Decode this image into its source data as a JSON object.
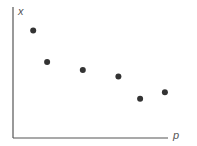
{
  "chart_data": {
    "type": "scatter",
    "title": "",
    "xlabel": "p",
    "ylabel": "x",
    "grid": false,
    "legend": null,
    "xlim": [
      0,
      10
    ],
    "ylim": [
      0,
      10
    ],
    "x": [
      1.3,
      2.2,
      4.5,
      6.8,
      8.2,
      9.8
    ],
    "y": [
      8.2,
      5.8,
      5.2,
      4.7,
      3.0,
      3.5
    ],
    "point_color": "#333333",
    "axis_color": "#555555"
  }
}
